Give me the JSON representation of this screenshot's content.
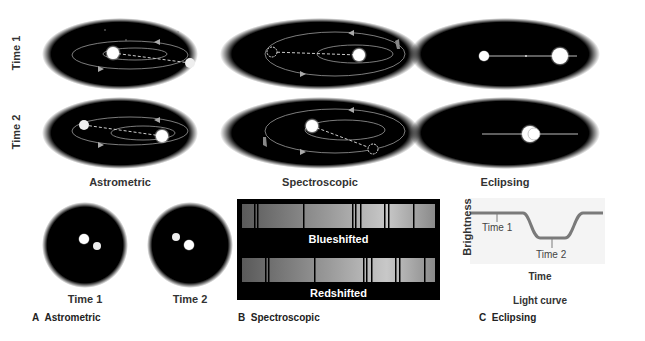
{
  "row_labels": {
    "time1": "Time 1",
    "time2": "Time 2"
  },
  "columns": {
    "astrometric": "Astrometric",
    "spectroscopic": "Spectroscopic",
    "eclipsing": "Eclipsing"
  },
  "panel_a": {
    "time1": "Time 1",
    "time2": "Time 2",
    "caption_letter": "A",
    "caption": "Astrometric"
  },
  "panel_b": {
    "spectrum_top": "Blueshifted",
    "spectrum_bottom": "Redshifted",
    "caption_letter": "B",
    "caption": "Spectroscopic"
  },
  "panel_c": {
    "ylabel": "Brightness",
    "xlabel": "Time",
    "marker1": "Time 1",
    "marker2": "Time 2",
    "title": "Light curve",
    "caption_letter": "C",
    "caption": "Eclipsing"
  },
  "colors": {
    "space": "#000000",
    "orbit": "#9a9a9a",
    "star": "#ffffff",
    "curve": "#7a7a7a",
    "label": "#333333"
  }
}
